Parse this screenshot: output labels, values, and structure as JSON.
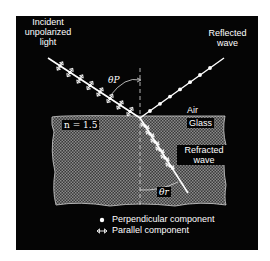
{
  "diagram": {
    "labels": {
      "incident": [
        "Incident",
        "unpolarized",
        "light"
      ],
      "reflected": [
        "Reflected",
        "wave"
      ],
      "refracted": [
        "Refracted",
        "wave"
      ],
      "air": "Air",
      "glass": "Glass",
      "index": "n = 1.5",
      "theta_p": "θP",
      "theta_r": "θr"
    },
    "legend": [
      {
        "symbol": "dot",
        "label": "Perpendicular component"
      },
      {
        "symbol": "double-arrow",
        "label": "Parallel component"
      }
    ],
    "colors": {
      "background": "#050505",
      "glass": "#6a6a6a",
      "rays": "#ffffff"
    }
  }
}
